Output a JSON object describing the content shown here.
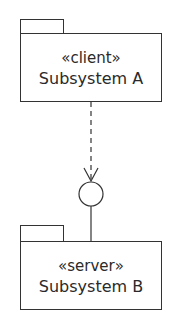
{
  "diagram": {
    "type": "UML component/subsystem diagram",
    "packages": [
      {
        "id": "A",
        "stereotype": "«client»",
        "name": "Subsystem A"
      },
      {
        "id": "B",
        "stereotype": "«server»",
        "name": "Subsystem B"
      }
    ],
    "connectors": [
      {
        "from": "A",
        "to": "interface",
        "style": "dashed",
        "arrow": "open"
      },
      {
        "from": "interface",
        "to": "B",
        "style": "solid",
        "arrow": "none"
      }
    ],
    "interface": {
      "shape": "lollipop-circle"
    },
    "colors": {
      "stroke": "#333333",
      "text": "#2a2a2a",
      "background": "#ffffff"
    }
  }
}
